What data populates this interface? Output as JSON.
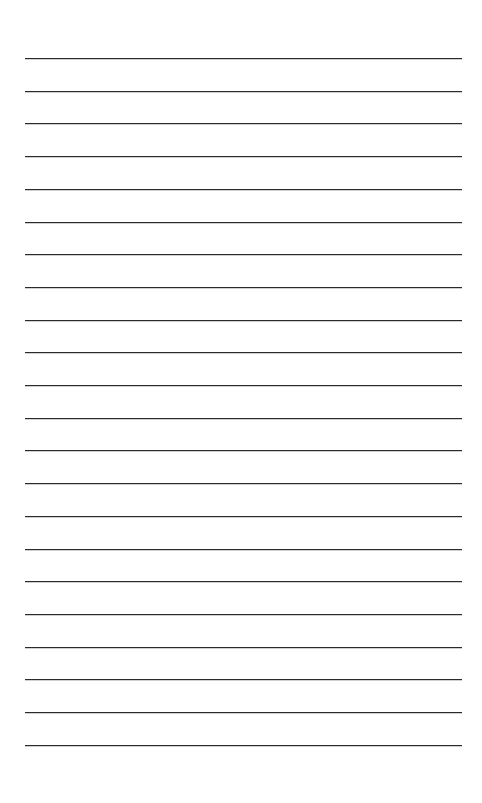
{
  "document": {
    "type": "lined-paper",
    "background_color": "#ffffff",
    "line_color": "#2b2b2b",
    "line_count": 22,
    "first_line_y": 58,
    "line_spacing": 32.7,
    "line_left": 25,
    "line_right": 462
  }
}
